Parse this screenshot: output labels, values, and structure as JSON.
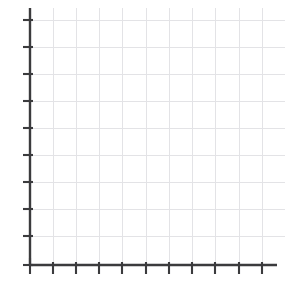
{
  "chart_data": {
    "type": "line",
    "title": "",
    "subtitle": "",
    "xlabel": "",
    "ylabel": "",
    "series": [
      {
        "name": "",
        "x": [],
        "y": [],
        "values": []
      }
    ],
    "categories": [],
    "x": [],
    "values": [],
    "annotations": [],
    "legend": {
      "entries": [],
      "position": "none",
      "visible": false
    },
    "grid": {
      "visible": true,
      "color": "#e3e3e6",
      "x_gridline_count": 11,
      "y_gridline_count": 9,
      "x_gridline_positions": [
        30,
        53,
        76,
        99,
        122,
        146,
        169,
        192,
        215,
        239,
        262
      ],
      "y_gridline_positions": [
        20,
        47,
        74,
        101,
        128,
        155,
        182,
        209,
        236
      ]
    },
    "axes": {
      "x": {
        "visible": true,
        "color": "#3b3b3d",
        "tick_labels": [],
        "tick_count": 12,
        "tick_positions": [
          30,
          53,
          76,
          99,
          122,
          146,
          169,
          192,
          215,
          239,
          262,
          277
        ],
        "range_px": [
          30,
          277
        ],
        "ylim": null
      },
      "y": {
        "visible": true,
        "color": "#3b3b3d",
        "tick_labels": [],
        "tick_count": 10,
        "tick_positions": [
          20,
          47,
          74,
          101,
          128,
          155,
          182,
          209,
          236,
          265
        ],
        "range_px": [
          8,
          265
        ]
      }
    },
    "plot_area": {
      "left": 30,
      "top": 8,
      "right": 285,
      "bottom": 265
    },
    "data_points": []
  },
  "figure": {
    "background_color": "#ffffff",
    "axis_color": "#3b3b3d",
    "grid_color": "#e3e3e6",
    "width": 290,
    "height": 287
  }
}
